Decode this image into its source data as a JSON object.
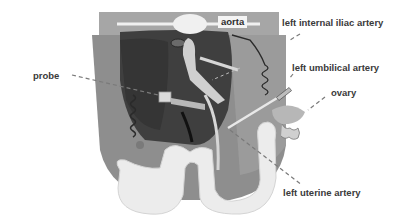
{
  "figure": {
    "colors": {
      "background": "#ffffff",
      "outer_tissue": "#8c8c8c",
      "inner_organ": "#3e3e3e",
      "vessels_light": "#d2d2d2",
      "bowel": "#ececec",
      "leader_line": "#7a7a7a",
      "label_text": "#3a3a3a"
    }
  },
  "labels": {
    "aorta": "aorta",
    "left_internal_iliac_artery": "left internal iliac artery",
    "left_umbilical_artery": "left umbilical artery",
    "ovary": "ovary",
    "probe": "probe",
    "left_uterine_artery": "left uterine artery"
  }
}
